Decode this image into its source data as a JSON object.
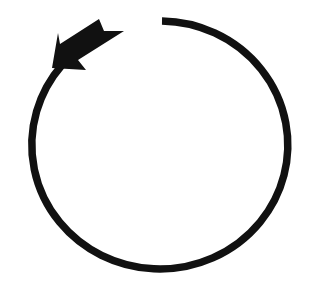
{
  "image": {
    "subject": "counterclockwise circular arrow",
    "colors": {
      "background": "#ffffff",
      "stroke": "#111111"
    }
  }
}
